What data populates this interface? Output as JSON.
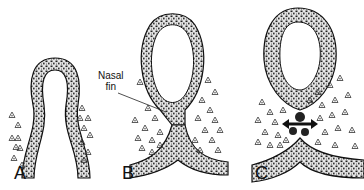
{
  "figure": {
    "panels": [
      {
        "label": "A",
        "stage": "initial epithelial fold"
      },
      {
        "label": "B",
        "stage": "fold closing, epithelial contact at nasal fin"
      },
      {
        "label": "C",
        "stage": "nasal fin disintegrating, mesenchyme merging"
      }
    ],
    "annotations": {
      "nasal_fin_line1": "Nasal",
      "nasal_fin_line2": "fin"
    },
    "colors": {
      "outline": "#111111",
      "epithelium_fill": "#d8d8d8",
      "background": "#ffffff"
    }
  }
}
